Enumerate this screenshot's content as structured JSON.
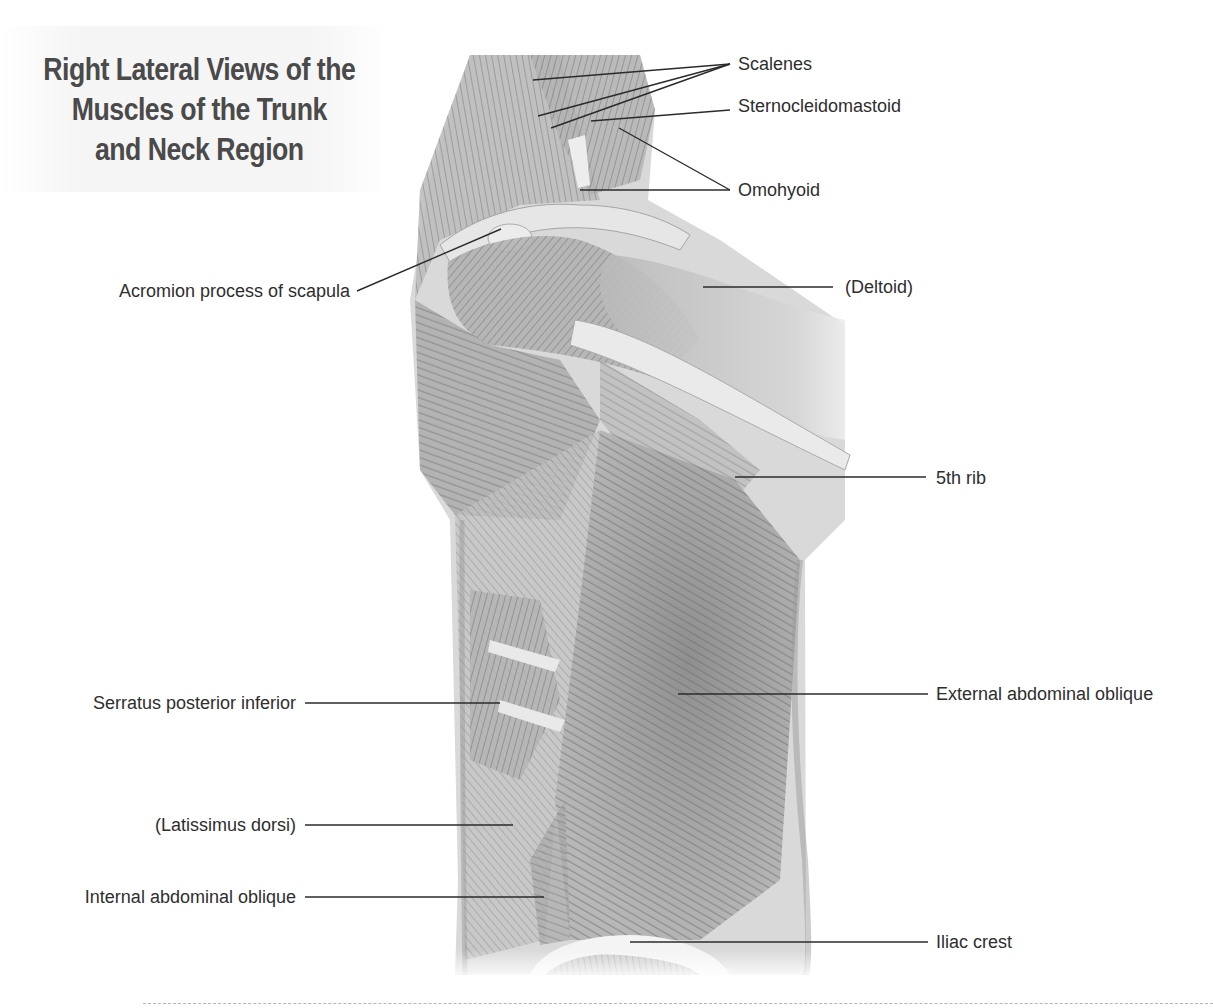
{
  "figure": {
    "title_lines": [
      "Right Lateral Views of the",
      "Muscles of the Trunk",
      "and Neck Region"
    ],
    "colors": {
      "text": "#2e2e2e",
      "title": "#4a4a4a",
      "leader": "#2b2b2b",
      "muscle_shade": "#9a9a9a",
      "background": "#ffffff"
    }
  },
  "labels": {
    "scalenes": "Scalenes",
    "sternocleidomastoid": "Sternocleidomastoid",
    "omohyoid": "Omohyoid",
    "acromion": "Acromion process of scapula",
    "deltoid": "(Deltoid)",
    "fifth_rib": "5th rib",
    "external_oblique": "External abdominal oblique",
    "serratus_posterior_inferior": "Serratus posterior inferior",
    "latissimus_dorsi": "(Latissimus dorsi)",
    "internal_oblique": "Internal abdominal oblique",
    "iliac_crest": "Iliac crest"
  }
}
